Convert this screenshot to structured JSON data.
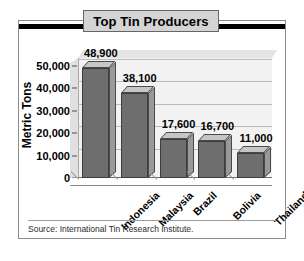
{
  "chart_data": {
    "type": "bar",
    "title": "Top Tin Producers",
    "xlabel": "",
    "ylabel": "Metric Tons",
    "categories": [
      "Indonesia",
      "Malaysia",
      "Brazil",
      "Bolivia",
      "Thailand"
    ],
    "values": [
      48900,
      38100,
      17600,
      16700,
      11000
    ],
    "value_labels": [
      "48,900",
      "38,100",
      "17,600",
      "16,700",
      "11,000"
    ],
    "ylim": [
      0,
      50000
    ],
    "yticks": [
      0,
      10000,
      20000,
      30000,
      40000,
      50000
    ],
    "ytick_labels": [
      "0",
      "10,000",
      "20,000",
      "30,000",
      "40,000",
      "50,000"
    ],
    "grid": true,
    "legend": false,
    "source": "Source: International Tin Research Institute.",
    "colors": {
      "bar_front": "#6e6e6e",
      "bar_top": "#c6c6c6",
      "bar_side": "#999999",
      "plot_background": "#f2f2f2",
      "title_banner": "#d4d4d4",
      "frame": "#8c8c8c",
      "text": "#000000"
    }
  }
}
